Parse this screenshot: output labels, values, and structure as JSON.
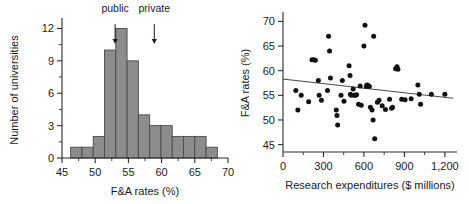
{
  "figure": {
    "panels": [
      "histogram",
      "scatter"
    ]
  },
  "chart_data": [
    {
      "id": "histogram",
      "type": "bar",
      "title": "",
      "xlabel": "F&A rates (%)",
      "ylabel": "Number of universities",
      "xlim": [
        45,
        70
      ],
      "ylim": [
        0,
        12.6
      ],
      "xticks": [
        45,
        50,
        55,
        60,
        65,
        70
      ],
      "xtick_labels": [
        "45",
        "50",
        "55",
        "60",
        "65",
        "70"
      ],
      "yticks": [
        0,
        3,
        6,
        9,
        12
      ],
      "ytick_labels": [
        "0",
        "3",
        "6",
        "9",
        "12"
      ],
      "grid": false,
      "bin_width": 1.7,
      "bin_edges": [
        46.3,
        48.0,
        49.7,
        51.4,
        53.1,
        54.8,
        56.5,
        58.2,
        59.9,
        61.6,
        63.3,
        65.0,
        66.7,
        68.4
      ],
      "bin_centers": [
        47.15,
        48.85,
        50.55,
        52.25,
        53.95,
        55.65,
        57.35,
        59.05,
        60.75,
        62.45,
        64.15,
        65.85,
        67.55
      ],
      "values": [
        1,
        1,
        2,
        10,
        12,
        9,
        4,
        3,
        3,
        2,
        2,
        1
      ],
      "bars": [
        {
          "left": 46.3,
          "right": 48.0,
          "count": 1
        },
        {
          "left": 48.0,
          "right": 49.7,
          "count": 1
        },
        {
          "left": 49.7,
          "right": 51.4,
          "count": 2
        },
        {
          "left": 51.4,
          "right": 53.1,
          "count": 10
        },
        {
          "left": 53.1,
          "right": 54.8,
          "count": 12
        },
        {
          "left": 54.8,
          "right": 56.5,
          "count": 9
        },
        {
          "left": 56.5,
          "right": 58.2,
          "count": 4
        },
        {
          "left": 58.2,
          "right": 59.9,
          "count": 3
        },
        {
          "left": 59.9,
          "right": 61.6,
          "count": 3
        },
        {
          "left": 61.6,
          "right": 63.3,
          "count": 2
        },
        {
          "left": 63.3,
          "right": 65.0,
          "count": 2
        },
        {
          "left": 65.0,
          "right": 66.7,
          "count": 2
        },
        {
          "left": 66.7,
          "right": 68.4,
          "count": 1
        }
      ],
      "annotations": [
        {
          "label": "public",
          "x": 53.0,
          "arrow_from_y": 12.4,
          "arrow_to_y": 10.6
        },
        {
          "label": "private",
          "x": 58.9,
          "arrow_from_y": 12.4,
          "arrow_to_y": 10.6
        }
      ],
      "bar_color": "#8c8c8c",
      "bar_edge_color": "#4a4a4a"
    },
    {
      "id": "scatter",
      "type": "scatter",
      "title": "",
      "xlabel": "Research expenditures ($ millions)",
      "ylabel": "F&A rates (%)",
      "xlim": [
        0,
        1290
      ],
      "ylim": [
        43.5,
        71.5
      ],
      "xticks": [
        0,
        300,
        600,
        900,
        1200
      ],
      "xtick_labels": [
        "0",
        "300",
        "600",
        "900",
        "1,200"
      ],
      "yticks": [
        45,
        50,
        55,
        60,
        65,
        70
      ],
      "ytick_labels": [
        "45",
        "50",
        "55",
        "60",
        "65",
        "70"
      ],
      "grid": false,
      "point_color": "#111111",
      "trendline": {
        "x": [
          0,
          1260
        ],
        "y": [
          58.3,
          54.4
        ],
        "color": "#333333"
      },
      "points": [
        [
          95,
          56.0
        ],
        [
          110,
          52.0
        ],
        [
          135,
          55.0
        ],
        [
          190,
          53.7
        ],
        [
          215,
          62.2
        ],
        [
          228,
          62.2
        ],
        [
          240,
          62.1
        ],
        [
          262,
          58.0
        ],
        [
          268,
          55.0
        ],
        [
          285,
          54.0
        ],
        [
          330,
          56.0
        ],
        [
          338,
          67.0
        ],
        [
          345,
          64.0
        ],
        [
          352,
          58.5
        ],
        [
          395,
          52.0
        ],
        [
          400,
          50.9
        ],
        [
          405,
          49.0
        ],
        [
          430,
          55.0
        ],
        [
          440,
          58.0
        ],
        [
          452,
          53.8
        ],
        [
          490,
          61.0
        ],
        [
          497,
          59.0
        ],
        [
          500,
          55.2
        ],
        [
          505,
          55.0
        ],
        [
          520,
          56.3
        ],
        [
          528,
          55.0
        ],
        [
          535,
          55.0
        ],
        [
          545,
          55.1
        ],
        [
          560,
          53.2
        ],
        [
          572,
          56.9
        ],
        [
          580,
          53.0
        ],
        [
          600,
          65.0
        ],
        [
          608,
          69.2
        ],
        [
          618,
          56.8
        ],
        [
          622,
          57.1
        ],
        [
          632,
          57.0
        ],
        [
          640,
          56.8
        ],
        [
          648,
          52.6
        ],
        [
          660,
          52.0
        ],
        [
          668,
          50.0
        ],
        [
          672,
          67.0
        ],
        [
          680,
          46.2
        ],
        [
          700,
          53.6
        ],
        [
          712,
          54.0
        ],
        [
          735,
          52.9
        ],
        [
          760,
          52.1
        ],
        [
          790,
          54.2
        ],
        [
          805,
          52.4
        ],
        [
          812,
          52.6
        ],
        [
          835,
          60.4
        ],
        [
          845,
          60.8
        ],
        [
          852,
          60.3
        ],
        [
          880,
          54.2
        ],
        [
          905,
          54.1
        ],
        [
          950,
          54.3
        ],
        [
          1000,
          57.1
        ],
        [
          1010,
          55.2
        ],
        [
          1020,
          53.2
        ],
        [
          1100,
          55.2
        ],
        [
          1200,
          55.2
        ]
      ]
    }
  ]
}
